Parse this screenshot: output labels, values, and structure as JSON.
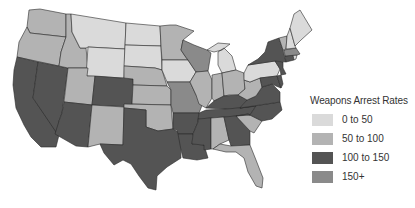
{
  "legend": {
    "title": "Weapons Arrest Rates",
    "items": [
      {
        "label": "0 to 50",
        "color": "#dadada"
      },
      {
        "label": "50 to 100",
        "color": "#b3b3b3"
      },
      {
        "label": "100 to 150",
        "color": "#545454"
      },
      {
        "label": "150+",
        "color": "#8a8a8a"
      }
    ]
  },
  "map": {
    "region": "United States (lower 48)",
    "states": {
      "WA": "50 to 100",
      "OR": "50 to 100",
      "ID": "50 to 100",
      "MT": "0 to 50",
      "WY": "0 to 50",
      "ND": "0 to 50",
      "SD": "0 to 50",
      "NE": "50 to 100",
      "KS": "50 to 100",
      "OK": "50 to 100",
      "MN": "50 to 100",
      "IA": "0 to 50",
      "UT": "50 to 100",
      "NM": "50 to 100",
      "CA": "100 to 150",
      "NV": "100 to 150",
      "AZ": "100 to 150",
      "CO": "100 to 150",
      "TX": "100 to 150",
      "WI": "150+",
      "MO": "150+",
      "AR": "100 to 150",
      "LA": "100 to 150",
      "MS": "100 to 150",
      "AL": "50 to 100",
      "GA": "100 to 150",
      "FL": "50 to 100",
      "SC": "50 to 100",
      "NC": "100 to 150",
      "TN": "100 to 150",
      "KY": "100 to 150",
      "IL": "50 to 100",
      "IN": "50 to 100",
      "OH": "50 to 100",
      "MI": "0 to 50",
      "WV": "50 to 100",
      "VA": "100 to 150",
      "MD": "100 to 150",
      "DE": "100 to 150",
      "PA": "0 to 50",
      "NJ": "100 to 150",
      "NY": "100 to 150",
      "CT": "100 to 150",
      "RI": "0 to 50",
      "MA": "150+",
      "VT": "50 to 100",
      "NH": "0 to 50",
      "ME": "0 to 50"
    }
  }
}
